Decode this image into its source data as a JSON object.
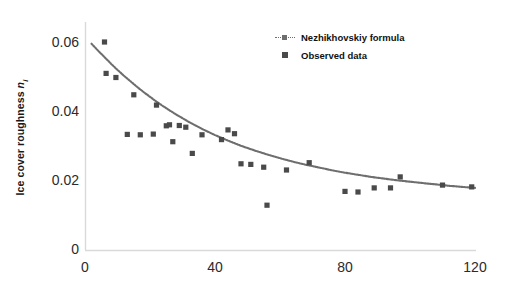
{
  "chart_data": {
    "type": "scatter",
    "title": "",
    "xlabel": "Number of days after the river has frozen",
    "ylabel": "Ice cover roughness n_i",
    "ylabel_prefix": "Ice cover roughness ",
    "ylabel_symbol": "n",
    "ylabel_subscript": "i",
    "xlim": [
      0,
      120
    ],
    "ylim": [
      0,
      0.06
    ],
    "xticks": [
      0,
      40,
      80,
      120
    ],
    "xtick_labels": [
      "0",
      "40",
      "80",
      "120"
    ],
    "yticks": [
      0,
      0.02,
      0.04,
      0.06
    ],
    "ytick_labels": [
      "0",
      "0.02",
      "0.04",
      "0.06"
    ],
    "grid": false,
    "legend_position": "upper right",
    "series": [
      {
        "name": "Nezhikhovskiy formula",
        "type": "line",
        "marker": "dotted-line",
        "color": "#6e6e6e",
        "x": [
          2,
          4,
          6,
          8,
          10,
          12,
          14,
          16,
          18,
          20,
          22,
          24,
          26,
          28,
          30,
          32,
          34,
          36,
          38,
          40,
          44,
          48,
          52,
          56,
          60,
          64,
          68,
          72,
          76,
          80,
          84,
          88,
          92,
          96,
          100,
          104,
          108,
          112,
          116,
          120
        ],
        "y": [
          0.0598,
          0.0578,
          0.0559,
          0.054,
          0.0522,
          0.0505,
          0.0489,
          0.0473,
          0.0458,
          0.0444,
          0.043,
          0.0417,
          0.0405,
          0.0393,
          0.0382,
          0.0371,
          0.0361,
          0.0351,
          0.0342,
          0.0333,
          0.0317,
          0.0302,
          0.0289,
          0.0277,
          0.0266,
          0.0256,
          0.0247,
          0.0239,
          0.0231,
          0.0224,
          0.0218,
          0.0212,
          0.0207,
          0.0202,
          0.0198,
          0.0194,
          0.019,
          0.0186,
          0.0183,
          0.018
        ]
      },
      {
        "name": "Observed data",
        "type": "scatter",
        "marker": "square",
        "color": "#4a4a4a",
        "points": [
          [
            6,
            0.0603
          ],
          [
            6.5,
            0.0512
          ],
          [
            9.5,
            0.05
          ],
          [
            15,
            0.045
          ],
          [
            13,
            0.0335
          ],
          [
            17,
            0.0334
          ],
          [
            21,
            0.0336
          ],
          [
            22,
            0.042
          ],
          [
            25,
            0.036
          ],
          [
            26,
            0.0363
          ],
          [
            29,
            0.0361
          ],
          [
            27,
            0.0314
          ],
          [
            31,
            0.0356
          ],
          [
            33,
            0.028
          ],
          [
            36,
            0.0334
          ],
          [
            42,
            0.032
          ],
          [
            44,
            0.0348
          ],
          [
            46,
            0.0337
          ],
          [
            48,
            0.025
          ],
          [
            51,
            0.0248
          ],
          [
            55,
            0.024
          ],
          [
            56,
            0.013
          ],
          [
            62,
            0.0232
          ],
          [
            69,
            0.0253
          ],
          [
            80,
            0.017
          ],
          [
            84,
            0.0168
          ],
          [
            89,
            0.018
          ],
          [
            94,
            0.018
          ],
          [
            97,
            0.0212
          ],
          [
            110,
            0.0188
          ],
          [
            119,
            0.0183
          ]
        ]
      }
    ]
  }
}
